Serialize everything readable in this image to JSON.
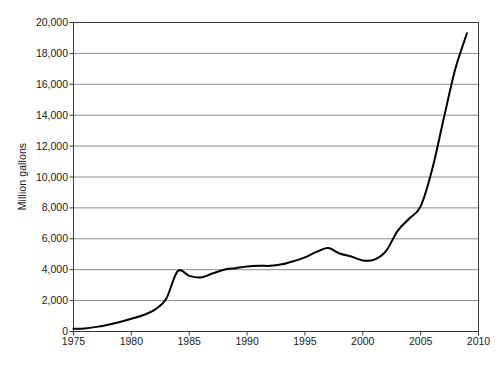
{
  "chart_data": {
    "type": "line",
    "title": "",
    "subtitle": "",
    "xlabel": "",
    "ylabel": "Million gallons",
    "xlim": [
      1975,
      2010
    ],
    "ylim": [
      0,
      20000
    ],
    "grid": "horizontal",
    "legend": "none",
    "x_tick_labels": [
      "1975",
      "1980",
      "1985",
      "1990",
      "1995",
      "2000",
      "2005",
      "2010"
    ],
    "x_ticks": [
      1975,
      1980,
      1985,
      1990,
      1995,
      2000,
      2005,
      2010
    ],
    "y_tick_labels": [
      "0",
      "2,000",
      "4,000",
      "6,000",
      "8,000",
      "10,000",
      "12,000",
      "14,000",
      "16,000",
      "18,000",
      "20,000"
    ],
    "y_ticks": [
      0,
      2000,
      4000,
      6000,
      8000,
      10000,
      12000,
      14000,
      16000,
      18000,
      20000
    ],
    "series": [
      {
        "name": "Production",
        "color": "#000000",
        "x": [
          1975,
          1976,
          1977,
          1978,
          1979,
          1980,
          1981,
          1982,
          1983,
          1984,
          1985,
          1986,
          1987,
          1988,
          1989,
          1990,
          1991,
          1992,
          1993,
          1994,
          1995,
          1996,
          1997,
          1998,
          1999,
          2000,
          2001,
          2002,
          2003,
          2004,
          2005,
          2006,
          2007,
          2008,
          2009
        ],
        "values": [
          175,
          200,
          300,
          440,
          620,
          830,
          1050,
          1400,
          2100,
          3900,
          3600,
          3500,
          3750,
          4000,
          4100,
          4200,
          4250,
          4250,
          4350,
          4550,
          4800,
          5150,
          5400,
          5050,
          4850,
          4600,
          4650,
          5200,
          6500,
          7300,
          8100,
          10500,
          13800,
          17000,
          19300
        ],
        "units": "million gallons"
      }
    ]
  },
  "axes": {
    "y_title": "Million gallons"
  },
  "caption": {
    "text": ""
  }
}
